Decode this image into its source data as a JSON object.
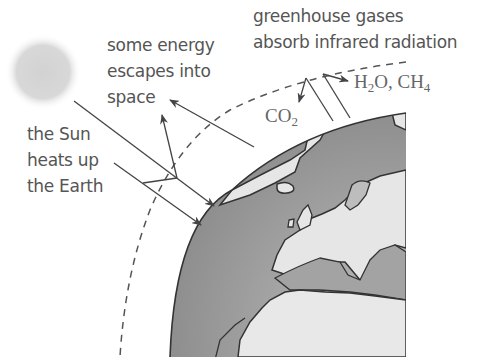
{
  "diagram": {
    "labels": {
      "escape": [
        "some energy",
        "escapes into",
        "space"
      ],
      "sun": [
        "the Sun",
        "heats up",
        "the Earth"
      ],
      "greenhouse": [
        "greenhouse gases",
        "absorb infrared radiation"
      ]
    },
    "chemicals": {
      "co2": {
        "base": "CO",
        "sub": "2"
      },
      "h2o_ch4": {
        "h": "H",
        "h_sub": "2",
        "o": "O, CH",
        "ch_sub": "4"
      }
    },
    "colors": {
      "ocean": "#9a9a9a",
      "land": "#e4e4e4",
      "line": "#444444",
      "sun": "#d6d6d6"
    },
    "elements": [
      "sun",
      "atmosphere-boundary-dashed",
      "earth-globe",
      "incoming-radiation-arrows",
      "reflected-radiation-arrows",
      "infrared-radiation-lines"
    ]
  }
}
